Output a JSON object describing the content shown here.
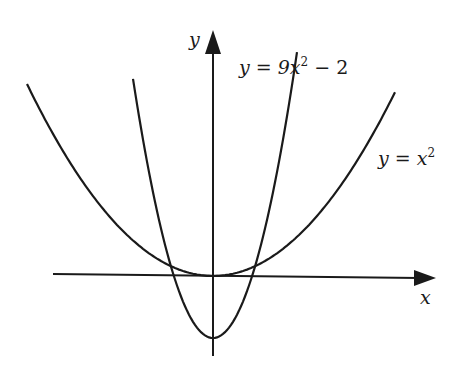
{
  "chart_data": {
    "type": "line",
    "title": "",
    "xlabel": "x",
    "ylabel": "y",
    "grid": false,
    "series": [
      {
        "name": "y = x^2",
        "label_text": "y = x²",
        "equation": "y = x^2",
        "vertex": [
          0,
          0
        ]
      },
      {
        "name": "y = 9x^2 - 2",
        "label_text": "y = 9x² − 2",
        "equation": "y = 9x^2 - 2",
        "vertex": [
          0,
          -2
        ]
      }
    ]
  },
  "labels": {
    "y_axis": "y",
    "x_axis": "x",
    "curve_narrow": {
      "prefix": "y = 9",
      "var": "x",
      "exp": "2",
      "suffix": " − 2"
    },
    "curve_wide": {
      "prefix": "y = ",
      "var": "x",
      "exp": "2"
    }
  },
  "colors": {
    "stroke": "#1a1a1a",
    "background": "#ffffff"
  }
}
